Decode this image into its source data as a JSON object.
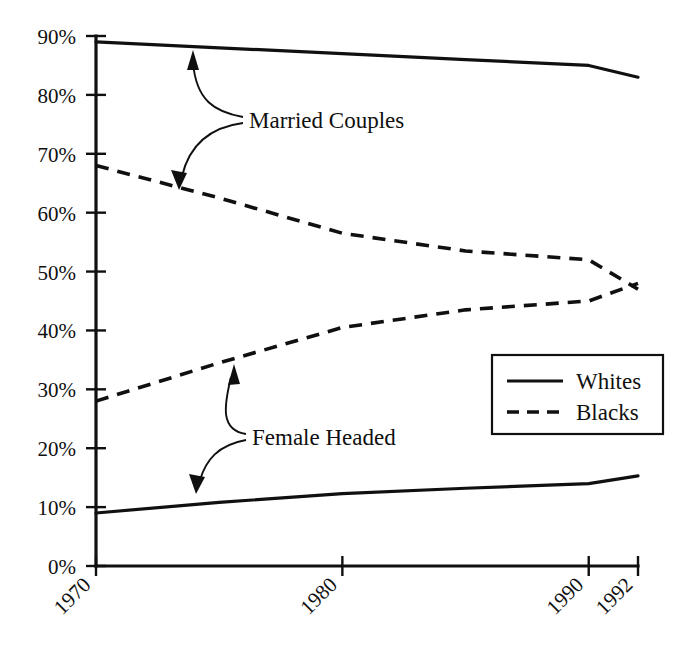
{
  "chart_data": {
    "type": "line",
    "title": "",
    "subtitle": "",
    "xlabel": "",
    "ylabel": "",
    "xlim": [
      1970,
      1992
    ],
    "ylim": [
      0,
      90
    ],
    "grid": false,
    "legend_position": "right-middle",
    "x_tick_labels": [
      "1970",
      "1980",
      "1990",
      "1992"
    ],
    "x_tick_values": [
      1970,
      1980,
      1990,
      1992
    ],
    "y_tick_labels": [
      "0%",
      "10%",
      "20%",
      "30%",
      "40%",
      "50%",
      "60%",
      "70%",
      "80%",
      "90%"
    ],
    "y_tick_values": [
      0,
      10,
      20,
      30,
      40,
      50,
      60,
      70,
      80,
      90
    ],
    "legend": [
      {
        "name": "Whites",
        "style": "solid"
      },
      {
        "name": "Blacks",
        "style": "dashed"
      }
    ],
    "annotations": [
      {
        "label": "Married Couples",
        "x": 1975.6,
        "y": 72
      },
      {
        "label": "Female Headed",
        "x": 1973.6,
        "y": 24.5
      }
    ],
    "series": [
      {
        "name": "Whites Married Couples",
        "group": "Married Couples",
        "legend": "Whites",
        "style": "solid",
        "x": [
          1970,
          1975,
          1980,
          1985,
          1990,
          1992
        ],
        "values": [
          89.0,
          88.0,
          87.0,
          86.0,
          85.0,
          83.0
        ]
      },
      {
        "name": "Blacks Married Couples",
        "group": "Married Couples",
        "legend": "Blacks",
        "style": "dashed",
        "x": [
          1970,
          1975,
          1980,
          1985,
          1990,
          1992
        ],
        "values": [
          68.0,
          62.5,
          56.5,
          53.5,
          52.0,
          47.0
        ]
      },
      {
        "name": "Blacks Female Headed",
        "group": "Female Headed",
        "legend": "Blacks",
        "style": "dashed",
        "x": [
          1970,
          1975,
          1980,
          1985,
          1990,
          1992
        ],
        "values": [
          28.0,
          34.5,
          40.5,
          43.5,
          45.0,
          48.0
        ]
      },
      {
        "name": "Whites Female Headed",
        "group": "Female Headed",
        "legend": "Whites",
        "style": "solid",
        "x": [
          1970,
          1975,
          1980,
          1985,
          1990,
          1992
        ],
        "values": [
          9.0,
          10.8,
          12.3,
          13.2,
          14.0,
          15.3
        ]
      }
    ]
  },
  "colors": {
    "ink": "#101010",
    "background": "#ffffff"
  }
}
